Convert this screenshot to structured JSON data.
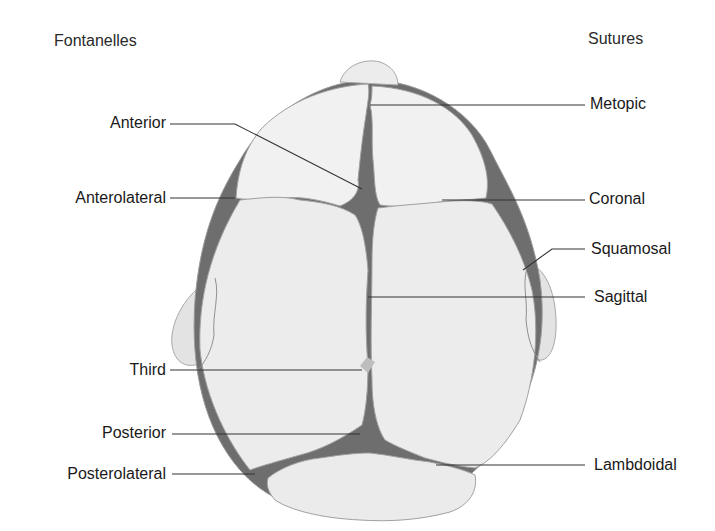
{
  "diagram": {
    "headers": {
      "left": "Fontanelles",
      "right": "Sutures"
    },
    "fontanelles": [
      {
        "id": "anterior",
        "label": "Anterior"
      },
      {
        "id": "anterolateral",
        "label": "Anterolateral"
      },
      {
        "id": "third",
        "label": "Third"
      },
      {
        "id": "posterior",
        "label": "Posterior"
      },
      {
        "id": "posterolateral",
        "label": "Posterolateral"
      }
    ],
    "sutures": [
      {
        "id": "metopic",
        "label": "Metopic"
      },
      {
        "id": "coronal",
        "label": "Coronal"
      },
      {
        "id": "squamosal",
        "label": "Squamosal"
      },
      {
        "id": "sagittal",
        "label": "Sagittal"
      },
      {
        "id": "lambdoidal",
        "label": "Lambdoidal"
      }
    ],
    "colors": {
      "bone": "#ececec",
      "bone_outline": "#9a9a9a",
      "fontanelle": "#6e6e6e",
      "third_fontanelle": "#bdbdbd",
      "leader_line": "#333333",
      "text": "#1a1a1a"
    }
  }
}
